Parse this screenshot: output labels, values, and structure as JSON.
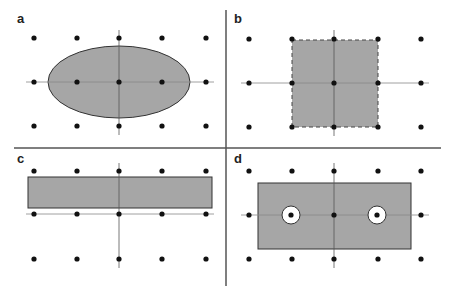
{
  "panels": [
    {
      "label": "a",
      "shape": "ellipse",
      "outline": "solid"
    },
    {
      "label": "b",
      "shape": "square",
      "outline": "dashed"
    },
    {
      "label": "c",
      "shape": "rectangle",
      "outline": "solid"
    },
    {
      "label": "d",
      "shape": "rectangle-with-holes",
      "outline": "solid"
    }
  ],
  "colors": {
    "fill": "#a6a6a6",
    "stroke": "#333333",
    "dot": "#111111",
    "axis": "#777777",
    "divider": "#555555"
  }
}
